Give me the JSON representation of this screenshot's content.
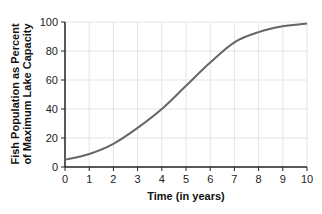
{
  "chart_data": {
    "type": "line",
    "title": "",
    "xlabel": "Time (in years)",
    "ylabel_line1": "Fish Population as Percent",
    "ylabel_line2": "of Maximum Lake Capacity",
    "ylabel": "Fish Population as Percent of Maximum Lake Capacity",
    "xlim": [
      0,
      10
    ],
    "ylim": [
      0,
      100
    ],
    "x_ticks": [
      0,
      1,
      2,
      3,
      4,
      5,
      6,
      7,
      8,
      9,
      10
    ],
    "y_ticks": [
      0,
      20,
      40,
      60,
      80,
      100
    ],
    "grid": true,
    "legend": null,
    "series": [
      {
        "name": "Fish Population",
        "color": "#666666",
        "x": [
          0,
          1,
          2,
          3,
          4,
          5,
          6,
          7,
          8,
          9,
          10
        ],
        "values": [
          5,
          9,
          16,
          27,
          40,
          56,
          72,
          86,
          93,
          97,
          99
        ]
      }
    ]
  }
}
